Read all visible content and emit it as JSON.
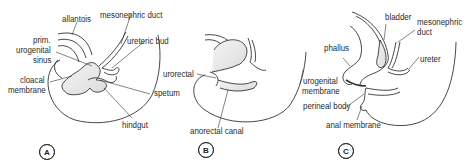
{
  "figure": {
    "panels": [
      {
        "id": "A",
        "badge": "A",
        "labels": {
          "allantois": "allantois",
          "mesonephric_duct": "mesonephric duct",
          "prim_1": "prim.",
          "prim_2": "urogenital",
          "prim_3": "sinus",
          "ureteric_bud": "ureteric bud",
          "cloacal_1": "cloacal",
          "cloacal_2": "membrane",
          "spetum": "spetum",
          "hindgut": "hindgut"
        }
      },
      {
        "id": "B",
        "badge": "B",
        "labels": {
          "urorectal": "urorectal",
          "anorectal_canal": "anorectal canal"
        }
      },
      {
        "id": "C",
        "badge": "C",
        "labels": {
          "bladder": "bladder",
          "mesonephric_1": "mesonephric",
          "mesonephric_2": "duct",
          "phallus": "phallus",
          "ureter": "ureter",
          "urogenital_1": "urogenital",
          "urogenital_2": "membrane",
          "perineal_body": "perineal body",
          "anal_membrane": "anal membrane"
        }
      }
    ]
  }
}
